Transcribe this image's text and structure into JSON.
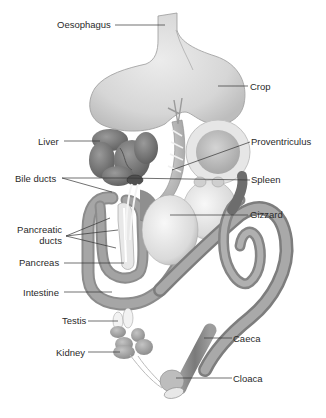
{
  "diagram": {
    "colors": {
      "background": "#ffffff",
      "crop": "#dcdcdc",
      "crop_stroke": "#8a8a8a",
      "liver": "#7b7b7b",
      "intestine": "#9a9a9a",
      "gizzard": "#e4e4e4",
      "proventriculus": "#cfcfcf",
      "caeca": "#8c8c8c",
      "kidney": "#a8a8a8",
      "testis": "#eeeeee",
      "leader_line": "#333333",
      "label_text": "#2a2a2a"
    },
    "labels": [
      {
        "id": "oesophagus",
        "text": "Oesophagus"
      },
      {
        "id": "crop",
        "text": "Crop"
      },
      {
        "id": "liver",
        "text": "Liver"
      },
      {
        "id": "proventriculus",
        "text": "Proventriculus"
      },
      {
        "id": "bile_ducts",
        "text": "Bile ducts"
      },
      {
        "id": "spleen",
        "text": "Spleen"
      },
      {
        "id": "gizzard",
        "text": "Gizzard"
      },
      {
        "id": "pancreatic_ducts_1",
        "text": "Pancreatic"
      },
      {
        "id": "pancreatic_ducts_2",
        "text": "ducts"
      },
      {
        "id": "pancreas",
        "text": "Pancreas"
      },
      {
        "id": "intestine",
        "text": "Intestine"
      },
      {
        "id": "testis",
        "text": "Testis"
      },
      {
        "id": "caeca",
        "text": "Caeca"
      },
      {
        "id": "kidney",
        "text": "Kidney"
      },
      {
        "id": "cloaca",
        "text": "Cloaca"
      }
    ]
  }
}
